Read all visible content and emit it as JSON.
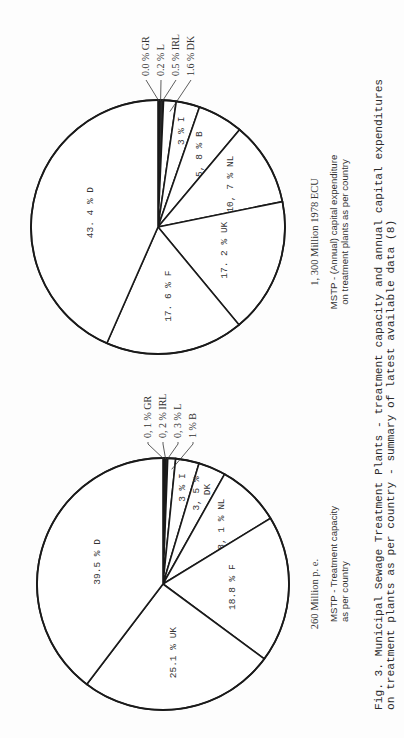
{
  "figure": {
    "caption_line1": "Fig. 3. Municipal Sewage Treatment Plants - treatment capacity and annual capital expenditures",
    "caption_line2": "on treatment plants as per country - summary of latest available data (8)"
  },
  "chart_data": [
    {
      "type": "pie",
      "id": "capacity",
      "title": "MSTP - Treatment capacity as per country",
      "title_line1": "MSTP - Treatment capacity",
      "title_line2": "as per country",
      "total_label": "260 Million p. e.",
      "unit": "%",
      "slices": [
        {
          "label": "GR",
          "value": 0.1,
          "text": "0, 1 % GR",
          "callout": true
        },
        {
          "label": "IRL",
          "value": 0.2,
          "text": "0, 2 % IRL",
          "callout": true
        },
        {
          "label": "L",
          "value": 0.3,
          "text": "0, 3 % L",
          "callout": true
        },
        {
          "label": "B",
          "value": 1,
          "text": "1 % B",
          "callout": true
        },
        {
          "label": "I",
          "value": 3,
          "text": "3 % I"
        },
        {
          "label": "DK",
          "value": 3.5,
          "text": "3, 5 %",
          "text2": "DK"
        },
        {
          "label": "NL",
          "value": 8.1,
          "text": "8, 1 % NL"
        },
        {
          "label": "F",
          "value": 18.8,
          "text": "18.8  %  F"
        },
        {
          "label": "UK",
          "value": 25.1,
          "text": "25.1  %  UK"
        },
        {
          "label": "D",
          "value": 39.5,
          "text": "39.5  %  D"
        }
      ]
    },
    {
      "type": "pie",
      "id": "expenditure",
      "title": "MSTP - (Annual) capital expenditure on treatment plants as per country",
      "title_line1": "MSTP - (Annual) capital expenditure",
      "title_line2": "on treatment plants as per country",
      "total_label": "1, 300 Million 1978 ECU",
      "unit": "%",
      "slices": [
        {
          "label": "GR",
          "value": 0.0,
          "text": "0.0 % GR",
          "callout": true
        },
        {
          "label": "L",
          "value": 0.2,
          "text": "0.2 % L",
          "callout": true
        },
        {
          "label": "IRL",
          "value": 0.5,
          "text": "0.5 % IRL",
          "callout": true
        },
        {
          "label": "DK",
          "value": 1.6,
          "text": "1.6 % DK",
          "callout": true
        },
        {
          "label": "I",
          "value": 3,
          "text": "3 % I"
        },
        {
          "label": "B",
          "value": 5.8,
          "text": "5, 8 % B"
        },
        {
          "label": "NL",
          "value": 10.7,
          "text": "10, 7  %  NL"
        },
        {
          "label": "UK",
          "value": 17.2,
          "text": "17. 2  %  UK"
        },
        {
          "label": "F",
          "value": 17.6,
          "text": "17. 6  %  F"
        },
        {
          "label": "D",
          "value": 43.4,
          "text": "43. 4  %  D"
        }
      ]
    }
  ]
}
